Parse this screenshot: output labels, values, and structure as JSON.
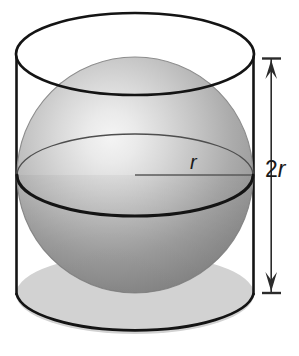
{
  "figure": {
    "name": "sphere-inscribed-in-cylinder",
    "type": "geometry-diagram",
    "background_color": "#ffffff",
    "labels": {
      "height_dimension": "2r",
      "height_dimension_number": "2",
      "height_dimension_variable": "r",
      "radius": "r"
    },
    "colors": {
      "outline": "#141414",
      "sphere_highlight": "#f2f2f2",
      "sphere_light": "#d9d9d9",
      "sphere_mid": "#a8a8a8",
      "sphere_dark": "#8a8a8a",
      "sphere_edge": "#7d7d7d",
      "cylinder_base_fill": "#d2d2d2",
      "equator_thin": "#4a4a4a",
      "radius_line": "#555555",
      "arrow": "#2b2b2b"
    },
    "geometry": {
      "cylinder": {
        "left_wall_x": 16,
        "right_wall_x": 254,
        "top_ellipse_center_y": 54,
        "bottom_ellipse_center_y": 294,
        "ellipse_rx": 119,
        "ellipse_ry": 41
      },
      "sphere": {
        "center_x": 135,
        "center_y": 175,
        "radius": 118,
        "highlight_x": 112,
        "highlight_y": 148,
        "equator_ry": 41
      },
      "radius_line": {
        "x1": 135,
        "y1": 175,
        "x2": 253,
        "y2": 175
      },
      "dimension_arrow": {
        "x": 271,
        "y_top": 58,
        "y_bottom": 293,
        "cap_half_width": 9
      }
    }
  }
}
